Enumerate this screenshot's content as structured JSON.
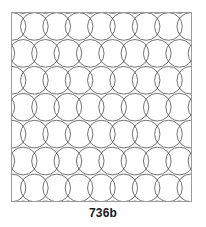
{
  "figure": {
    "caption": "736b",
    "title": "736b",
    "frame": {
      "x": 11,
      "y": 12,
      "width": 181,
      "height": 190,
      "border_color": "#9a9a9a",
      "background_color": "#ffffff"
    }
  },
  "pattern": {
    "name": "overlapping-circles-quilting-pattern",
    "type": "interlocking-circles",
    "stroke_color": "#4d4d4d",
    "stroke_width": 0.8,
    "fill": "none",
    "circle_radius": 14,
    "column_spacing": 22.6,
    "row_spacing": 27.2,
    "columns": 9,
    "rows": 8,
    "row_offset": 11.3,
    "description": "Grid of outlined circles in which adjacent circles overlap horizontally and alternate rows are offset by half the column spacing, producing an interlaced lens/vesica motif."
  },
  "colors": {
    "page_background": "#ffffff",
    "line": "#4d4d4d",
    "frame_border": "#9a9a9a",
    "caption_text": "#1a1a1a"
  }
}
